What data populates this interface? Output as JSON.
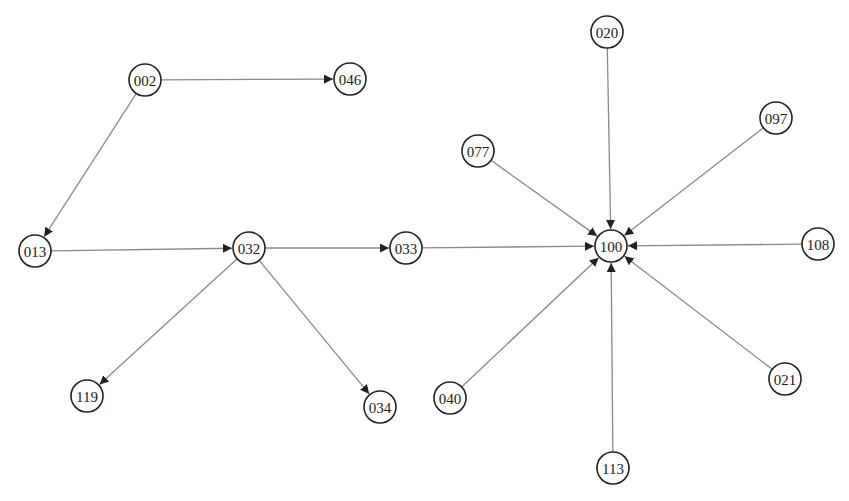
{
  "diagram": {
    "type": "directed-graph",
    "node_radius": 16,
    "colors": {
      "edge": "#8a8a8a",
      "node_stroke": "#222222",
      "node_fill": "#ffffff",
      "arrow": "#222222",
      "text": "#1a1a1a"
    },
    "nodes": [
      {
        "id": "002",
        "x": 145,
        "y": 80
      },
      {
        "id": "046",
        "x": 350,
        "y": 79
      },
      {
        "id": "013",
        "x": 35,
        "y": 251
      },
      {
        "id": "032",
        "x": 249,
        "y": 248
      },
      {
        "id": "033",
        "x": 406,
        "y": 248
      },
      {
        "id": "119",
        "x": 87,
        "y": 396
      },
      {
        "id": "034",
        "x": 380,
        "y": 407
      },
      {
        "id": "020",
        "x": 607,
        "y": 32
      },
      {
        "id": "097",
        "x": 776,
        "y": 118
      },
      {
        "id": "077",
        "x": 478,
        "y": 151
      },
      {
        "id": "100",
        "x": 611,
        "y": 246
      },
      {
        "id": "108",
        "x": 818,
        "y": 244
      },
      {
        "id": "040",
        "x": 450,
        "y": 398
      },
      {
        "id": "113",
        "x": 613,
        "y": 468
      },
      {
        "id": "021",
        "x": 785,
        "y": 379
      }
    ],
    "edges": [
      {
        "from": "002",
        "to": "046"
      },
      {
        "from": "002",
        "to": "013"
      },
      {
        "from": "013",
        "to": "032"
      },
      {
        "from": "032",
        "to": "033"
      },
      {
        "from": "032",
        "to": "119"
      },
      {
        "from": "032",
        "to": "034"
      },
      {
        "from": "033",
        "to": "100"
      },
      {
        "from": "020",
        "to": "100"
      },
      {
        "from": "097",
        "to": "100"
      },
      {
        "from": "077",
        "to": "100"
      },
      {
        "from": "108",
        "to": "100"
      },
      {
        "from": "040",
        "to": "100"
      },
      {
        "from": "113",
        "to": "100"
      },
      {
        "from": "021",
        "to": "100"
      }
    ]
  }
}
